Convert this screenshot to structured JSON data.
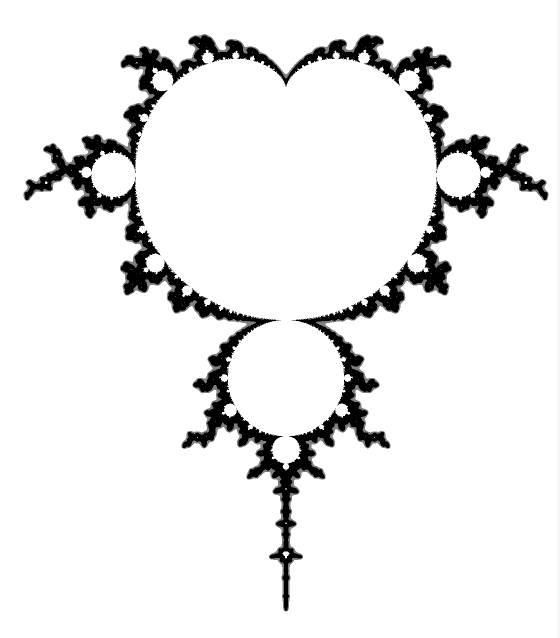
{
  "image": {
    "subject": "Mandelbrot set boundary",
    "width": 560,
    "height": 638,
    "background_color": "#ffffff",
    "ink_color": "#000000"
  },
  "fractal": {
    "orientation": "cardioid-cusp-up, real axis vertical (negative real downward)",
    "cusp_px": [
      286,
      88
    ],
    "scale_px_per_unit": 232,
    "center_x_px": 286,
    "features": [
      {
        "name": "main-cardioid",
        "cusp_px": [
          286,
          88
        ],
        "left_px": 136,
        "right_px": 438
      },
      {
        "name": "period-2-bulb",
        "center_px": [
          286,
          378
        ],
        "radius_px": 58
      },
      {
        "name": "period-3-bulb-left",
        "center_px": [
          115,
          177
        ],
        "radius_px": 21
      },
      {
        "name": "period-3-bulb-right",
        "center_px": [
          457,
          177
        ],
        "radius_px": 21
      },
      {
        "name": "period-4-bulb",
        "center_px": [
          286,
          450
        ],
        "radius_px": 14
      },
      {
        "name": "mini-mandelbrot",
        "center_px": [
          287,
          551
        ]
      },
      {
        "name": "antenna-tip",
        "px": [
          286,
          610
        ]
      }
    ],
    "max_iterations": 400
  }
}
